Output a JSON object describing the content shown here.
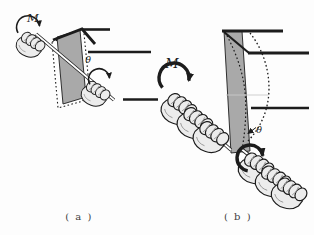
{
  "figure": {
    "background": "#fdfdfd",
    "ink_color": "#1c1c1c",
    "panel_fill": "#a9a9a9",
    "hand_fill": "#ececec",
    "subfigures": [
      {
        "id": "a",
        "caption": "( a )",
        "moment_label": "M",
        "twist_angle_label": "θ"
      },
      {
        "id": "b",
        "caption": "( b )",
        "moment_label": "M",
        "twist_angle_label": "θ"
      }
    ]
  }
}
